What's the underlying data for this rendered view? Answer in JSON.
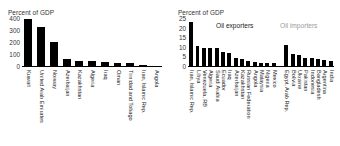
{
  "chart_data": [
    {
      "type": "bar",
      "panel": "left",
      "title": "Percent of GDP",
      "ylabel": "Percent of GDP",
      "xlabel": "",
      "ylim": [
        0,
        400
      ],
      "yticks": [
        0,
        100,
        200,
        300,
        400
      ],
      "ytick_labels": [
        "0",
        "100",
        "200",
        "300",
        "400"
      ],
      "grid": false,
      "legend": "none",
      "bar_color": "#000000",
      "categories": [
        "Kuwait",
        "United Arab Emirates",
        "Norway",
        "Azerbaijan",
        "Kazakhstan",
        "Algeria",
        "Iraq",
        "Oman",
        "Trinidad and Tobago",
        "Iran, Islamic Rep.",
        "Angola"
      ],
      "values": [
        395,
        325,
        200,
        62,
        42,
        40,
        33,
        28,
        27,
        12,
        2
      ]
    },
    {
      "type": "bar",
      "panel": "right",
      "title": "Percent of GDP",
      "ylabel": "Percent of GDP",
      "xlabel": "",
      "ylim": [
        0,
        25
      ],
      "yticks": [
        0,
        5,
        10,
        15,
        20,
        25
      ],
      "ytick_labels": [
        "0",
        "5",
        "10",
        "15",
        "20",
        "25"
      ],
      "grid": false,
      "legend": "none",
      "bar_color": "#000000",
      "annotations": [
        {
          "text": "Oil exporters",
          "color": "#1a1a1a"
        },
        {
          "text": "Oil importers",
          "color": "#9a9a9a"
        }
      ],
      "categories": [
        "Iran, Islamic Rep.",
        "Libya",
        "Venezuela, RB",
        "Algeria",
        "Saudi Arabia",
        "Ecuador",
        "Iraq",
        "Azerbaijan",
        "Kazakhstan",
        "Russian Federation",
        "Angola",
        "Malaysia",
        "Nigeria",
        "Mexico",
        "",
        "Egypt, Arab Rep.",
        "Bolivia",
        "Ukraine",
        "Pakistan",
        "Indonesia",
        "Bangladesh",
        "Argentina",
        "India"
      ],
      "values": [
        23,
        10.5,
        9.6,
        9.5,
        9.3,
        7.4,
        7.0,
        4.1,
        3.6,
        2.6,
        2.0,
        1.8,
        1.6,
        1.5,
        0,
        11.0,
        6.2,
        5.6,
        4.1,
        4.0,
        3.5,
        3.3,
        2.5
      ]
    }
  ]
}
